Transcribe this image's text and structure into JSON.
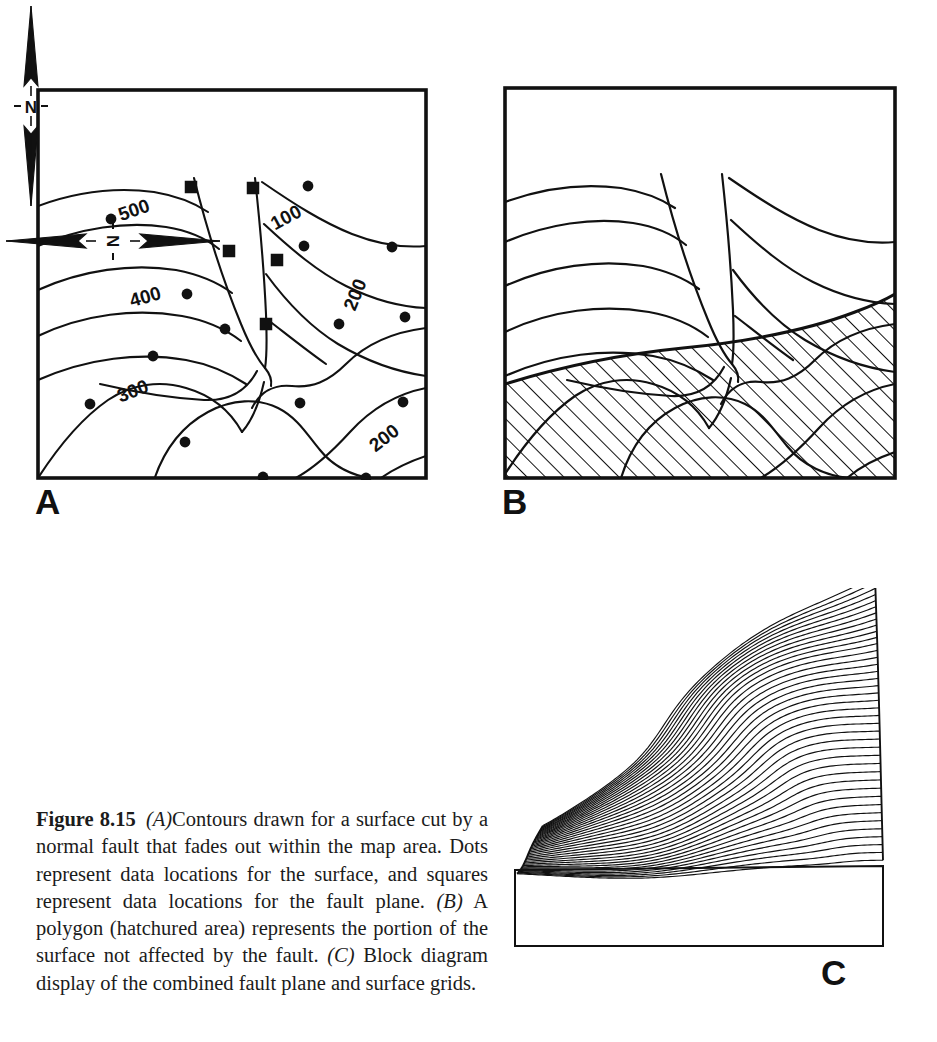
{
  "figure": {
    "label": "Figure 8.15",
    "caption_segments": [
      {
        "type": "bold",
        "text": "Figure 8.15"
      },
      {
        "type": "space",
        "text": " "
      },
      {
        "type": "italic",
        "text": "(A)"
      },
      {
        "type": "plain",
        "text": "Contours drawn for a surface cut by a normal fault that fades out within the map area. Dots represent data locations for the surface, and squares represent data locations for the fault plane. "
      },
      {
        "type": "italic",
        "text": "(B)"
      },
      {
        "type": "plain",
        "text": " A polygon (hatchured area) represents the portion of the surface not affected by the fault. "
      },
      {
        "type": "italic",
        "text": "(C)"
      },
      {
        "type": "plain",
        "text": " Block diagram display of the combined fault plane and surface grids."
      }
    ],
    "caption_text": "Figure 8.15  (A) Contours drawn for a surface cut by a normal fault that fades out within the map area. Dots represent data locations for the surface, and squares represent data locations for the fault plane. (B) A polygon (hatchured area) represents the portion of the surface not affected by the fault. (C) Block diagram display of the combined fault plane and surface grids."
  },
  "panels": {
    "a": {
      "letter": "A",
      "description": "Contour map of a surface cut by a normal fault",
      "contour_labels": [
        {
          "text": "500",
          "x": 100,
          "y": 128,
          "rotate": -19
        },
        {
          "text": "100",
          "x": 253,
          "y": 135,
          "rotate": -28
        },
        {
          "text": "400",
          "x": 111,
          "y": 215,
          "rotate": -16
        },
        {
          "text": "200",
          "x": 325,
          "y": 209,
          "rotate": -68
        },
        {
          "text": "300",
          "x": 99,
          "y": 309,
          "rotate": -21
        },
        {
          "text": "200",
          "x": 352,
          "y": 355,
          "rotate": -38
        }
      ],
      "contour_interval": 100,
      "contour_values": [
        100,
        200,
        300,
        400,
        500
      ],
      "surface_data_points": [
        {
          "x": 75,
          "y": 131
        },
        {
          "x": 272,
          "y": 98
        },
        {
          "x": 151,
          "y": 206
        },
        {
          "x": 189,
          "y": 241
        },
        {
          "x": 117,
          "y": 268
        },
        {
          "x": 303,
          "y": 236
        },
        {
          "x": 369,
          "y": 229
        },
        {
          "x": 268,
          "y": 158
        },
        {
          "x": 356,
          "y": 159
        },
        {
          "x": 54,
          "y": 316
        },
        {
          "x": 264,
          "y": 315
        },
        {
          "x": 367,
          "y": 314
        },
        {
          "x": 149,
          "y": 354
        },
        {
          "x": 227,
          "y": 389
        },
        {
          "x": 330,
          "y": 390
        },
        {
          "x": 77,
          "y": 427
        },
        {
          "x": 238,
          "y": 466
        }
      ],
      "fault_data_points": [
        {
          "x": 155,
          "y": 99
        },
        {
          "x": 217,
          "y": 100
        },
        {
          "x": 193,
          "y": 163
        },
        {
          "x": 241,
          "y": 172
        },
        {
          "x": 230,
          "y": 236
        }
      ],
      "legend_note": "Dots = surface data locations; squares = fault-plane data locations"
    },
    "b": {
      "letter": "B",
      "description": "Same contours with hatchured polygon over the portion of the surface not affected by the fault",
      "hatch_label": "hatchured area"
    },
    "c": {
      "letter": "C",
      "description": "Block diagram display of the combined fault plane and surface grids",
      "profile_line_count": 40
    }
  },
  "north_arrows": [
    {
      "id": "north-arrow-panel-a",
      "label": "N",
      "orientation": "vertical",
      "tick_left": "-",
      "tick_right": "-"
    },
    {
      "id": "north-arrow-panel-c",
      "label": "N",
      "orientation": "horizontal",
      "tick_top": "-",
      "tick_bottom": "-"
    }
  ],
  "colors": {
    "ink": "#111111",
    "paper": "#ffffff",
    "caption_ink": "#1b1b1b"
  }
}
